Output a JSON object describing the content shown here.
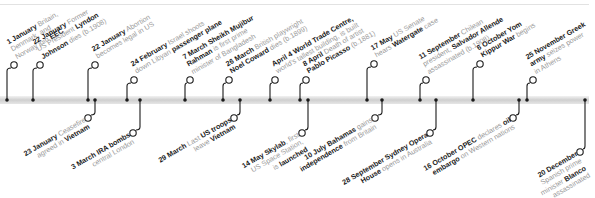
{
  "timeline": {
    "year_events": [
      {
        "id": "e1",
        "side": "top",
        "tick_x": 7,
        "circle": [
          14,
          65
        ],
        "date": "1 January",
        "lines": [
          [
            "1 January",
            " Britain,"
          ],
          [
            "Denmark, and"
          ],
          [
            "Norway join ",
            "EEC"
          ]
        ]
      },
      {
        "id": "e2",
        "side": "top",
        "tick_x": 33,
        "circle": [
          40,
          65
        ],
        "date": "22 January",
        "lines": [
          [
            "22 January",
            " Former"
          ],
          [
            "US President ",
            "Lyndon"
          ],
          [
            "Johnson",
            " dies (b.1908)"
          ]
        ]
      },
      {
        "id": "e3",
        "side": "top",
        "tick_x": 88,
        "circle": [
          95,
          65
        ],
        "date": "22 January",
        "lines": [
          [
            "22 January",
            " Abortion"
          ],
          [
            "becomes legal in US"
          ]
        ]
      },
      {
        "id": "e4",
        "side": "top",
        "tick_x": 127,
        "circle": [
          134,
          80
        ],
        "date": "24 February",
        "lines": [
          [
            "24 February",
            " Israel shoots"
          ],
          [
            "down Libyan ",
            "passenger plane"
          ]
        ]
      },
      {
        "id": "e5",
        "side": "top",
        "tick_x": 185,
        "circle": [
          190,
          80
        ],
        "date": "7 March",
        "lines": [
          [
            "7 March Sheikh Mujibur"
          ],
          [
            "Rahman",
            " is first prime"
          ],
          [
            "minister of Bangladesh"
          ]
        ]
      },
      {
        "id": "e6",
        "side": "top",
        "tick_x": 223,
        "circle": [
          229,
          80
        ],
        "date": "26 March",
        "lines": [
          [
            "26 March",
            " British playwright"
          ],
          [
            "Noel Coward",
            " dies (b.1899)"
          ]
        ]
      },
      {
        "id": "e7",
        "side": "top",
        "tick_x": 270,
        "circle": [
          275,
          80
        ],
        "date": "April 4",
        "lines": [
          [
            "April 4 World Trade Centre,"
          ],
          [
            "world's tallest building, is built"
          ]
        ]
      },
      {
        "id": "e8",
        "side": "top",
        "tick_x": 300,
        "circle": [
          306,
          80
        ],
        "date": "8 April",
        "lines": [
          [
            "8 April",
            " Death of artist"
          ],
          [
            "Pablo Picasso",
            " (b.1881)"
          ]
        ]
      },
      {
        "id": "e9",
        "side": "top",
        "tick_x": 367,
        "circle": [
          374,
          64
        ],
        "date": "17 May",
        "lines": [
          [
            "17 May",
            " US Senate"
          ],
          [
            "hears ",
            "Watergate",
            " case"
          ]
        ]
      },
      {
        "id": "e10",
        "side": "top",
        "tick_x": 420,
        "circle": [
          426,
          80
        ],
        "date": "11 September",
        "lines": [
          [
            "11 September",
            " Chilean"
          ],
          [
            "president, ",
            "Salvador Allende"
          ],
          [
            "assassinated (b.1908)"
          ]
        ]
      },
      {
        "id": "e11",
        "side": "top",
        "tick_x": 473,
        "circle": [
          480,
          64
        ],
        "date": "6 October",
        "lines": [
          [
            "6 October Yom"
          ],
          [
            "Kippur War",
            " begins"
          ]
        ]
      },
      {
        "id": "e12",
        "side": "top",
        "tick_x": 527,
        "circle": [
          533,
          80
        ],
        "date": "25 November",
        "lines": [
          [
            "25 November Greek"
          ],
          [
            "army",
            " seizes power"
          ],
          [
            "in Athens"
          ]
        ]
      },
      {
        "id": "e13",
        "side": "bottom",
        "tick_x": 95,
        "circle": [
          88,
          118
        ],
        "date": "23 January",
        "lines": [
          [
            "23 January",
            " Ceasefire"
          ],
          [
            "agreed in ",
            "Vietnam"
          ]
        ]
      },
      {
        "id": "e14",
        "side": "bottom",
        "tick_x": 140,
        "circle": [
          133,
          133
        ],
        "date": "3 March",
        "lines": [
          [
            "3 March IRA bombs"
          ],
          [
            "central London"
          ]
        ]
      },
      {
        "id": "e15",
        "side": "bottom",
        "tick_x": 240,
        "circle": [
          234,
          118
        ],
        "date": "29 March",
        "lines": [
          [
            "29 March",
            " Last ",
            "US troops"
          ],
          [
            "leave ",
            "Vietnam"
          ]
        ]
      },
      {
        "id": "e16",
        "side": "bottom",
        "tick_x": 308,
        "circle": [
          302,
          133
        ],
        "date": "14 May",
        "lines": [
          [
            "14 May Skylab",
            ", first"
          ],
          [
            "US Space Station,"
          ],
          [
            "is ",
            "launched"
          ]
        ]
      },
      {
        "id": "e17",
        "side": "bottom",
        "tick_x": 382,
        "circle": [
          375,
          118
        ],
        "date": "10 July",
        "lines": [
          [
            "10 July Bahamas",
            " gains"
          ],
          [
            "independence",
            " from Britain"
          ]
        ]
      },
      {
        "id": "e18",
        "side": "bottom",
        "tick_x": 436,
        "circle": [
          430,
          133
        ],
        "date": "28 September",
        "lines": [
          [
            "28 September Sydney Opera"
          ],
          [
            "House",
            " opens in Australia"
          ]
        ]
      },
      {
        "id": "e19",
        "side": "bottom",
        "tick_x": 519,
        "circle": [
          513,
          118
        ],
        "date": "16 October",
        "lines": [
          [
            "16 October OPEC",
            " declares ",
            "oil"
          ],
          [
            "embargo",
            " on Western nations"
          ]
        ]
      },
      {
        "id": "e20",
        "side": "bottom",
        "tick_x": 585,
        "circle": [
          580,
          152
        ],
        "date": "20 December",
        "lines": [
          [
            "20 December"
          ],
          [
            "Spanish prime"
          ],
          [
            "minister ",
            "Blanco"
          ],
          [
            "assassinated"
          ]
        ]
      }
    ]
  },
  "colors": {
    "axis": "#d0d0d0",
    "ink": "#1a1a1a",
    "muted": "#9a9a9a"
  }
}
